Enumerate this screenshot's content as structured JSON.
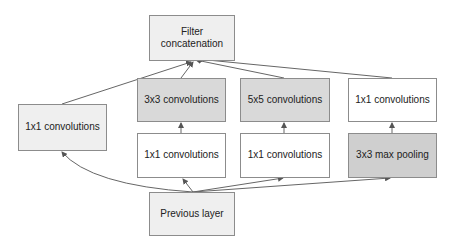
{
  "diagram": {
    "nodes": {
      "concat": {
        "label_line1": "Filter",
        "label_line2": "concatenation"
      },
      "left_1x1": {
        "label": "1x1 convolutions"
      },
      "conv3x3": {
        "label": "3x3 convolutions"
      },
      "reduce_3x3": {
        "label": "1x1 convolutions"
      },
      "conv5x5": {
        "label": "5x5 convolutions"
      },
      "reduce_5x5": {
        "label": "1x1 convolutions"
      },
      "pool_proj": {
        "label": "1x1 convolutions"
      },
      "maxpool": {
        "label": "3x3 max pooling"
      },
      "previous": {
        "label": "Previous layer"
      }
    },
    "edges": [
      {
        "from": "previous",
        "to": "left_1x1"
      },
      {
        "from": "previous",
        "to": "reduce_3x3"
      },
      {
        "from": "previous",
        "to": "reduce_5x5"
      },
      {
        "from": "previous",
        "to": "maxpool"
      },
      {
        "from": "reduce_3x3",
        "to": "conv3x3"
      },
      {
        "from": "reduce_5x5",
        "to": "conv5x5"
      },
      {
        "from": "maxpool",
        "to": "pool_proj"
      },
      {
        "from": "left_1x1",
        "to": "concat"
      },
      {
        "from": "conv3x3",
        "to": "concat"
      },
      {
        "from": "conv5x5",
        "to": "concat"
      },
      {
        "from": "pool_proj",
        "to": "concat"
      }
    ],
    "colors": {
      "border": "#8c8c8c",
      "edge": "#555555",
      "white_fill": "#ffffff",
      "light_fill": "#efefef",
      "gray_fill": "#d9d9d9"
    }
  }
}
